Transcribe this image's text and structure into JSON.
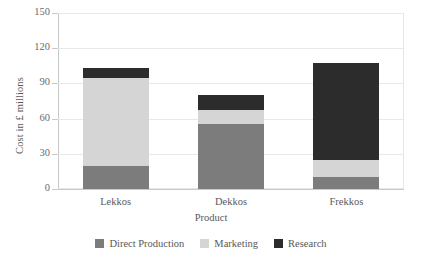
{
  "chart_data": {
    "type": "bar",
    "stacked": true,
    "title": "",
    "xlabel": "Product",
    "ylabel": "Cost in £ millions",
    "categories": [
      "Lekkos",
      "Dekkos",
      "Frekkos"
    ],
    "series": [
      {
        "name": "Direct Production",
        "color": "#7c7c7c",
        "values": [
          20,
          55,
          10
        ]
      },
      {
        "name": "Marketing",
        "color": "#d5d5d5",
        "values": [
          75,
          12,
          15
        ]
      },
      {
        "name": "Research",
        "color": "#2c2c2c",
        "values": [
          8,
          13,
          82
        ]
      }
    ],
    "totals": [
      103,
      80,
      107
    ],
    "ylim": [
      0,
      150
    ],
    "yticks": [
      0,
      30,
      60,
      90,
      120,
      150
    ],
    "ytick_labels": [
      "0",
      "30",
      "60",
      "90",
      "120",
      "150"
    ],
    "grid": true,
    "legend_position": "bottom"
  },
  "axes": {
    "y_title": "Cost in £ millions",
    "x_title": "Product"
  },
  "legend": {
    "items": [
      {
        "label": "Direct Production",
        "color": "#7c7c7c"
      },
      {
        "label": "Marketing",
        "color": "#d5d5d5"
      },
      {
        "label": "Research",
        "color": "#2c2c2c"
      }
    ]
  }
}
